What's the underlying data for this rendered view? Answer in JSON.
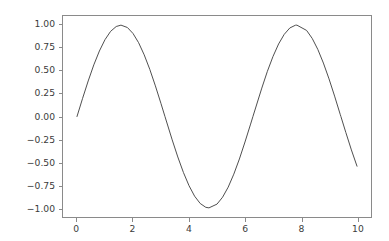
{
  "figure": {
    "background_color": "#ffffff",
    "axes_edge_color": "#8a8a8a",
    "tick_label_color": "#3b3b3b"
  },
  "chart_data": {
    "type": "line",
    "title": "",
    "subtitle": "",
    "xlabel": "",
    "ylabel": "",
    "xlim": [
      -0.5,
      10.5
    ],
    "ylim": [
      -1.1,
      1.1
    ],
    "grid": false,
    "legend": null,
    "annotations": [],
    "line_color": "#4d4d4d",
    "line_width": 1.0,
    "xticks": [
      0,
      2,
      4,
      6,
      8,
      10
    ],
    "xtick_labels": [
      "0",
      "2",
      "4",
      "6",
      "8",
      "10"
    ],
    "yticks": [
      -1.0,
      -0.75,
      -0.5,
      -0.25,
      0.0,
      0.25,
      0.5,
      0.75,
      1.0
    ],
    "ytick_labels": [
      "1.00",
      "0.75",
      "0.50",
      "0.25",
      "0.00",
      "−0.25",
      "−0.50",
      "−0.75",
      "−1.00"
    ],
    "series": [
      {
        "name": "sin(x)",
        "x": [
          0.0,
          0.2,
          0.4,
          0.6,
          0.8,
          1.0,
          1.2,
          1.4,
          1.5708,
          1.8,
          2.0,
          2.2,
          2.4,
          2.6,
          2.8,
          3.0,
          3.1416,
          3.4,
          3.6,
          3.8,
          4.0,
          4.2,
          4.4,
          4.6,
          4.7124,
          5.0,
          5.2,
          5.4,
          5.6,
          5.8,
          6.0,
          6.2,
          6.2832,
          6.6,
          6.8,
          7.0,
          7.2,
          7.4,
          7.6,
          7.8,
          7.854,
          8.2,
          8.4,
          8.6,
          8.8,
          9.0,
          9.2,
          9.4,
          9.425,
          9.6,
          9.8,
          10.0
        ],
        "y": [
          0.0,
          0.199,
          0.389,
          0.565,
          0.717,
          0.841,
          0.932,
          0.985,
          1.0,
          0.974,
          0.909,
          0.808,
          0.675,
          0.516,
          0.335,
          0.141,
          0.0,
          -0.256,
          -0.443,
          -0.612,
          -0.757,
          -0.872,
          -0.952,
          -0.994,
          -1.0,
          -0.959,
          -0.883,
          -0.773,
          -0.631,
          -0.465,
          -0.279,
          -0.083,
          0.0,
          0.311,
          0.495,
          0.657,
          0.794,
          0.899,
          0.969,
          0.999,
          1.0,
          0.942,
          0.855,
          0.735,
          0.585,
          0.412,
          0.223,
          0.024,
          0.0,
          -0.174,
          -0.366,
          -0.544
        ]
      }
    ]
  }
}
